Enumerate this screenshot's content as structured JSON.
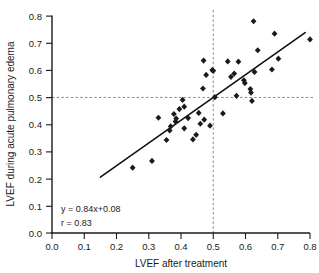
{
  "chart_data": {
    "type": "scatter",
    "title": "",
    "xlabel": "LVEF after treatment",
    "ylabel": "LVEF during acute pulmonary edema",
    "xlim": [
      0.0,
      0.8
    ],
    "ylim": [
      0.0,
      0.8
    ],
    "xticks": [
      "0.0",
      "0.1",
      "0.2",
      "0.3",
      "0.4",
      "0.5",
      "0.6",
      "0.7",
      "0.8"
    ],
    "yticks": [
      "0.0",
      "0.1",
      "0.2",
      "0.3",
      "0.4",
      "0.5",
      "0.6",
      "0.7",
      "0.8"
    ],
    "xtick_values": [
      0.0,
      0.1,
      0.2,
      0.3,
      0.4,
      0.5,
      0.6,
      0.7,
      0.8
    ],
    "ytick_values": [
      0.0,
      0.1,
      0.2,
      0.3,
      0.4,
      0.5,
      0.6,
      0.7,
      0.8
    ],
    "grid": false,
    "legend": "none",
    "marker": "diamond",
    "marker_color": "#1a1a1a",
    "points": [
      [
        0.25,
        0.241
      ],
      [
        0.31,
        0.266
      ],
      [
        0.33,
        0.425
      ],
      [
        0.355,
        0.343
      ],
      [
        0.365,
        0.378
      ],
      [
        0.368,
        0.393
      ],
      [
        0.378,
        0.439
      ],
      [
        0.383,
        0.411
      ],
      [
        0.385,
        0.422
      ],
      [
        0.395,
        0.457
      ],
      [
        0.405,
        0.491
      ],
      [
        0.41,
        0.466
      ],
      [
        0.41,
        0.386
      ],
      [
        0.422,
        0.424
      ],
      [
        0.437,
        0.345
      ],
      [
        0.447,
        0.362
      ],
      [
        0.455,
        0.443
      ],
      [
        0.46,
        0.403
      ],
      [
        0.468,
        0.533
      ],
      [
        0.47,
        0.636
      ],
      [
        0.472,
        0.418
      ],
      [
        0.478,
        0.583
      ],
      [
        0.49,
        0.396
      ],
      [
        0.497,
        0.601
      ],
      [
        0.5,
        0.598
      ],
      [
        0.505,
        0.501
      ],
      [
        0.53,
        0.441
      ],
      [
        0.545,
        0.633
      ],
      [
        0.555,
        0.576
      ],
      [
        0.565,
        0.588
      ],
      [
        0.572,
        0.506
      ],
      [
        0.578,
        0.632
      ],
      [
        0.595,
        0.563
      ],
      [
        0.598,
        0.553
      ],
      [
        0.615,
        0.531
      ],
      [
        0.617,
        0.518
      ],
      [
        0.62,
        0.487
      ],
      [
        0.625,
        0.781
      ],
      [
        0.628,
        0.594
      ],
      [
        0.638,
        0.674
      ],
      [
        0.682,
        0.603
      ],
      [
        0.69,
        0.735
      ],
      [
        0.702,
        0.643
      ],
      [
        0.8,
        0.714
      ]
    ],
    "fit_line": {
      "slope": 0.84,
      "intercept": 0.08,
      "x_start": 0.15,
      "x_end": 0.785
    },
    "reference_lines": [
      {
        "orientation": "vertical",
        "value": 0.5
      },
      {
        "orientation": "horizontal",
        "value": 0.5
      }
    ],
    "annotations": [
      {
        "text": "y = 0.84x+0.08",
        "x": 0.115,
        "y": 0.115
      },
      {
        "text": "r = 0.83",
        "x": 0.115,
        "y": 0.062
      }
    ]
  }
}
